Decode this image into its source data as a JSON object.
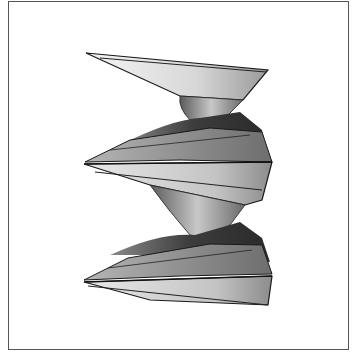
{
  "figure": {
    "colors": {
      "frame": "#555555",
      "background": "#ffffff",
      "edge": "#1a1a1a",
      "light": "#e6e6e6",
      "mid": "#9a9a9a",
      "dark": "#3a3a3a"
    }
  }
}
